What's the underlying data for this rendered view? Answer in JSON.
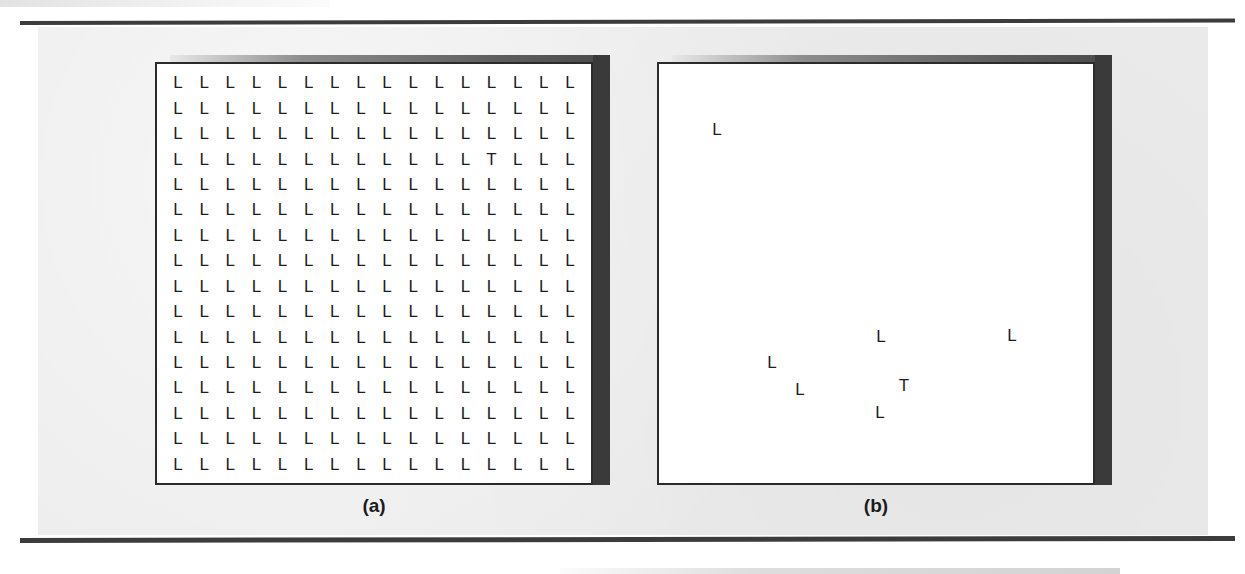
{
  "figure": {
    "panels": [
      {
        "id": "a",
        "caption": "(a)",
        "condition_name": "dense-display",
        "layout": "grid",
        "rows": 16,
        "cols": 16,
        "total_items": 256,
        "distractor_letter": "L",
        "target_letter": "T",
        "target_row": 4,
        "target_col": 13
      },
      {
        "id": "b",
        "caption": "(b)",
        "condition_name": "sparse-display",
        "layout": "scattered",
        "total_items": 6,
        "distractor_letter": "L",
        "target_letter": "T",
        "items": [
          {
            "char": "L",
            "x": 58,
            "y": 65
          },
          {
            "char": "L",
            "x": 222,
            "y": 272
          },
          {
            "char": "L",
            "x": 353,
            "y": 271
          },
          {
            "char": "L",
            "x": 113,
            "y": 298
          },
          {
            "char": "L",
            "x": 141,
            "y": 325
          },
          {
            "char": "T",
            "x": 245,
            "y": 321
          },
          {
            "char": "L",
            "x": 221,
            "y": 348
          }
        ]
      }
    ]
  },
  "colors": {
    "page_background": "#ffffff",
    "figure_field": "#ececec",
    "panel_background": "#ffffff",
    "panel_border": "#2b2b2b",
    "panel_shadow": "#3a3a3a",
    "rule": "#3c3c3c",
    "glyph": "#1d1d1d"
  },
  "chart_data": {
    "type": "scatter",
    "title": "",
    "xlabel": "",
    "ylabel": "",
    "series": [
      {
        "name": "(a) dense-display",
        "description": "16 x 16 grid of letters; 255 distractor 'L' items and 1 target 'T'",
        "grid_rows": 16,
        "grid_cols": 16,
        "distractor": "L",
        "target": "T",
        "target_position": {
          "row": 4,
          "col": 13
        },
        "item_count": 256
      },
      {
        "name": "(b) sparse-display",
        "description": "6 scattered letters; 5 distractor 'L' items and 1 target 'T'",
        "distractor": "L",
        "target": "T",
        "item_count": 7,
        "points": [
          {
            "char": "L",
            "x": 58,
            "y": 65
          },
          {
            "char": "L",
            "x": 222,
            "y": 272
          },
          {
            "char": "L",
            "x": 353,
            "y": 271
          },
          {
            "char": "L",
            "x": 113,
            "y": 298
          },
          {
            "char": "L",
            "x": 141,
            "y": 325
          },
          {
            "char": "T",
            "x": 245,
            "y": 321
          },
          {
            "char": "L",
            "x": 221,
            "y": 348
          }
        ]
      }
    ],
    "legend_position": "none",
    "grid": false
  }
}
